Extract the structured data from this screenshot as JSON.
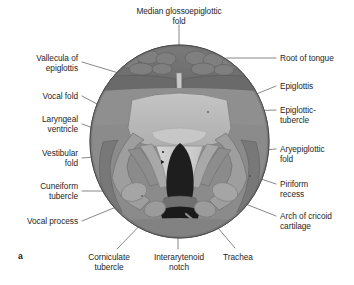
{
  "figure": {
    "letter": "a",
    "view_type": "laryngoscopic-view-of-larynx",
    "colors": {
      "rim_outer": "#7d7d7d",
      "rim_inner": "#8e8e8e",
      "tongue_root": "#6e6e6e",
      "mucosa_mid": "#a3a3a3",
      "epiglottis": "#b9b9b9",
      "vestibular_fold": "#9a9a9a",
      "vocal_fold": "#cfcfcf",
      "glottis_dark": "#1e1e1e",
      "trachea_band": "#6a6a6a",
      "outline": "#4a4a4a",
      "leader_line": "#555555",
      "text": "#262626",
      "background": "#ffffff"
    }
  },
  "labels": {
    "median_glossoepiglottic_fold": "Median glossoepiglottic\nfold",
    "vallecula_of_epiglottis": "Vallecula of\nepiglottis",
    "vocal_fold": "Vocal fold",
    "laryngeal_ventricle": "Laryngeal\nventricle",
    "vestibular_fold": "Vestibular\nfold",
    "cuneiform_tubercle": "Cuneiform\ntubercle",
    "vocal_process": "Vocal process",
    "corniculate_tubercle": "Corniculate\ntubercle",
    "interarytenoid_notch": "Interarytenoid\nnotch",
    "trachea": "Trachea",
    "arch_of_cricoid_cartilage": "Arch of cricoid\ncartilage",
    "piriform_recess": "Piriform\nrecess",
    "aryepiglottic_fold": "Aryepiglottic\nfold",
    "epiglottic_tubercle": "Epiglottic-\ntubercle",
    "epiglottis": "Epiglottis",
    "root_of_tongue": "Root of tongue"
  }
}
